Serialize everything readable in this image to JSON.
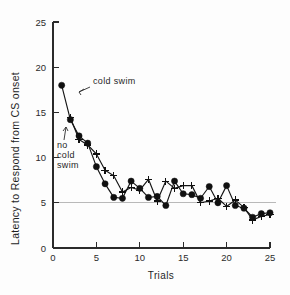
{
  "chart_data": {
    "type": "line",
    "title": "",
    "xlabel": "Trials",
    "ylabel": "Latency to Respond from CS onset",
    "xlim": [
      0,
      25
    ],
    "ylim": [
      0,
      25
    ],
    "xticks": [
      0,
      5,
      10,
      15,
      20,
      25
    ],
    "yticks": [
      0,
      5,
      10,
      15,
      20,
      25
    ],
    "grid": "horizontal-reference-line-at-5",
    "reference_line_y": 5,
    "legend_position": "inline-annotations",
    "annotations": [
      {
        "text": "cold swim",
        "target_series": "cold swim",
        "x": 1,
        "y": 18
      },
      {
        "text": "no cold swim",
        "target_series": "no cold swim",
        "x": 2,
        "y": 14.3
      }
    ],
    "series": [
      {
        "name": "cold swim",
        "marker": "filled-circle",
        "x": [
          1,
          2,
          3,
          4,
          5,
          6,
          7,
          8,
          9,
          10,
          11,
          12,
          13,
          14,
          15,
          16,
          17,
          18,
          19,
          20,
          21,
          22,
          23,
          24,
          25
        ],
        "values": [
          18.0,
          14.2,
          12.4,
          11.6,
          9.0,
          7.1,
          5.6,
          5.5,
          7.4,
          6.6,
          5.6,
          5.7,
          4.7,
          7.4,
          6.0,
          5.9,
          5.5,
          6.8,
          5.0,
          6.9,
          4.7,
          4.4,
          3.4,
          3.8,
          3.9
        ]
      },
      {
        "name": "no cold swim",
        "marker": "plus",
        "x": [
          2,
          3,
          4,
          5,
          6,
          7,
          8,
          9,
          10,
          11,
          12,
          13,
          14,
          15,
          16,
          17,
          18,
          19,
          20,
          21,
          22,
          23,
          24,
          25
        ],
        "values": [
          14.4,
          12.0,
          11.4,
          10.4,
          8.6,
          8.0,
          6.2,
          6.7,
          6.4,
          7.6,
          5.2,
          7.4,
          6.6,
          6.9,
          6.9,
          5.0,
          5.2,
          5.5,
          4.6,
          5.3,
          4.5,
          3.1,
          3.5,
          3.7
        ]
      }
    ],
    "colors": {
      "series_line": "#151515",
      "axis": "#2b2b2b",
      "reference_line": "#b9b9b9",
      "background": "#fdfdfd"
    }
  }
}
